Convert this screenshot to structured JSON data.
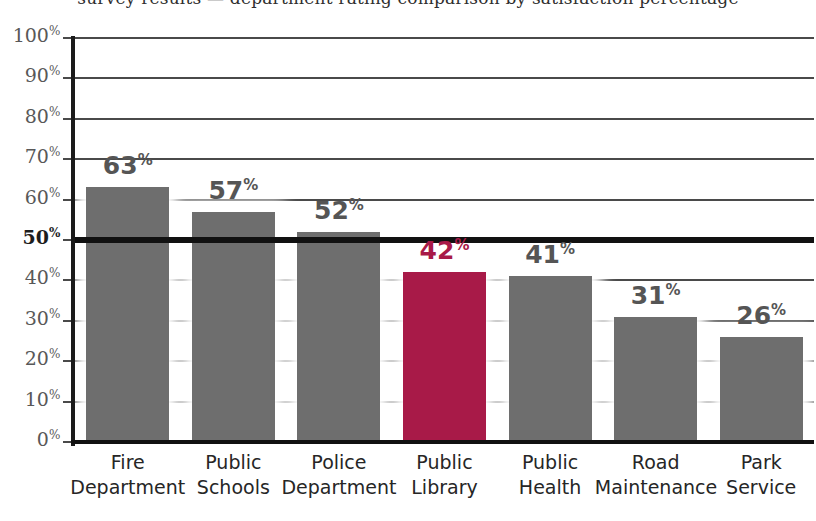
{
  "figure": {
    "top_caption": "survey results — department rating comparison by satisfaction percentage"
  },
  "chart_data": {
    "type": "bar",
    "title": "",
    "xlabel": "",
    "ylabel": "",
    "ylim": [
      0,
      100
    ],
    "grid": true,
    "legend_position": "none",
    "categories": [
      "Fire Department",
      "Public Schools",
      "Police Department",
      "Public Library",
      "Public Health",
      "Road Maintenance",
      "Park Service"
    ],
    "category_lines": [
      [
        "Fire",
        "Department"
      ],
      [
        "Public",
        "Schools"
      ],
      [
        "Police",
        "Department"
      ],
      [
        "Public",
        "Library"
      ],
      [
        "Public",
        "Health"
      ],
      [
        "Road",
        "Maintenance"
      ],
      [
        "Park",
        "Service"
      ]
    ],
    "values": [
      63,
      57,
      52,
      42,
      41,
      31,
      26
    ],
    "value_labels": [
      "63",
      "57",
      "52",
      "42",
      "41",
      "31",
      "26"
    ],
    "value_suffix": "%",
    "highlight_index": 3,
    "bar_color": "#6e6e6e",
    "highlight_color": "#a81a48",
    "label_color": "#555555",
    "highlight_label_color": "#a81a48",
    "reference_line": {
      "value": 50,
      "label": "50",
      "emphasized": true,
      "color": "#111111"
    },
    "ytick_values": [
      0,
      10,
      20,
      30,
      40,
      50,
      60,
      70,
      80,
      90,
      100
    ],
    "ytick_labels": [
      "0",
      "10",
      "20",
      "30",
      "40",
      "50",
      "60",
      "70",
      "80",
      "90",
      "100"
    ],
    "ytick_suffix": "%"
  }
}
